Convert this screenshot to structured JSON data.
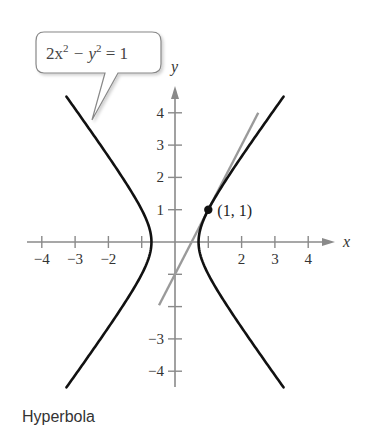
{
  "caption": "Hyperbola",
  "colors": {
    "curve": "#111111",
    "tangent": "#9a9a9a",
    "axis": "#8a8a8a",
    "text": "#333333",
    "callout_border": "#888888"
  },
  "chart_data": {
    "type": "line",
    "title": "",
    "caption": "Hyperbola",
    "equation": "2x^2 - y^2 = 1",
    "xlabel": "x",
    "ylabel": "y",
    "xlim": [
      -4.5,
      4.7
    ],
    "ylim": [
      -4.5,
      4.9
    ],
    "grid": false,
    "x_ticks": [
      -4,
      -3,
      -2,
      -1,
      1,
      2,
      3,
      4
    ],
    "x_tick_labels": [
      "-4",
      "-3",
      "-2",
      "",
      "",
      "2",
      "3",
      "4"
    ],
    "y_ticks": [
      -4,
      -3,
      -2,
      -1,
      1,
      2,
      3,
      4
    ],
    "y_tick_labels": [
      "-4",
      "-3",
      "",
      "",
      "1",
      "2",
      "3",
      "4"
    ],
    "series": [
      {
        "name": "Hyperbola 2x^2 - y^2 = 1 (right branch)",
        "style": "solid-black",
        "x": [
          3.26,
          2.55,
          1.87,
          1.22,
          0.87,
          0.707,
          0.87,
          1.22,
          1.87,
          2.55,
          3.26
        ],
        "y": [
          -4.5,
          -3.5,
          -2.5,
          -1.5,
          -0.7,
          0,
          0.7,
          1.5,
          2.5,
          3.5,
          4.5
        ]
      },
      {
        "name": "Hyperbola 2x^2 - y^2 = 1 (left branch)",
        "style": "solid-black",
        "x": [
          -3.26,
          -2.55,
          -1.87,
          -1.22,
          -0.87,
          -0.707,
          -0.87,
          -1.22,
          -1.87,
          -2.55,
          -3.26
        ],
        "y": [
          -4.5,
          -3.5,
          -2.5,
          -1.5,
          -0.7,
          0,
          0.7,
          1.5,
          2.5,
          3.5,
          4.5
        ]
      },
      {
        "name": "Tangent line at (1, 1): y = 2x - 1",
        "style": "solid-gray",
        "x": [
          -0.48,
          2.5
        ],
        "y": [
          -1.96,
          4.0
        ]
      }
    ],
    "points": [
      {
        "x": 1,
        "y": 1,
        "label": "(1, 1)"
      }
    ],
    "annotations": [
      {
        "type": "callout",
        "text": "2x² − y² = 1",
        "points_to": "left branch"
      }
    ]
  },
  "callout": {
    "base": "2x",
    "exp1": "2",
    "minus": " − y",
    "exp2": "2",
    "rest": " = 1"
  }
}
